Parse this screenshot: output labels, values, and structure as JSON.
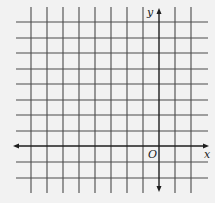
{
  "diagram": {
    "type": "coordinate-grid",
    "background": "#f2f2f2",
    "grid_color": "#4a4a4a",
    "axis_color": "#1e1e1e",
    "grid_spacing_px": 16,
    "vertical_lines_x": [
      31,
      47,
      63,
      79,
      95,
      111,
      127,
      143,
      175,
      191
    ],
    "horizontal_lines_y": [
      22,
      38,
      53,
      69,
      84,
      100,
      115,
      131,
      162,
      178
    ],
    "x_axis": {
      "y": 146,
      "x_start": 13,
      "x_end": 209,
      "label": "x"
    },
    "y_axis": {
      "x": 159,
      "y_start": 8,
      "y_end": 192,
      "label": "y"
    },
    "origin_label": "O",
    "grid_extent": {
      "left": 16,
      "right": 208,
      "top": 7,
      "bottom": 193
    },
    "units_left_of_origin": 8,
    "units_right_of_origin": 2,
    "units_above_origin": 8,
    "units_below_origin": 2
  }
}
